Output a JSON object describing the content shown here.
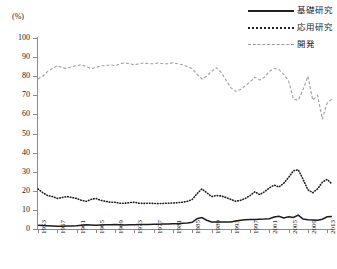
{
  "chart_data": {
    "type": "line",
    "title": "",
    "xlabel": "",
    "ylabel": "(%)",
    "unit_label": "(%)",
    "ylim": [
      0,
      100
    ],
    "yticks": [
      0,
      10,
      20,
      30,
      40,
      50,
      60,
      70,
      80,
      90,
      100
    ],
    "grid": false,
    "legend_position": "top-right",
    "x": [
      1953,
      1954,
      1955,
      1956,
      1957,
      1958,
      1959,
      1960,
      1961,
      1962,
      1963,
      1964,
      1965,
      1966,
      1967,
      1968,
      1969,
      1970,
      1971,
      1972,
      1973,
      1974,
      1975,
      1976,
      1977,
      1978,
      1979,
      1980,
      1981,
      1982,
      1983,
      1984,
      1985,
      1986,
      1987,
      1988,
      1989,
      1990,
      1991,
      1992,
      1993,
      1994,
      1995,
      1996,
      1997,
      1998,
      1999,
      2000,
      2001,
      2002,
      2003,
      2004,
      2005,
      2006,
      2007,
      2008,
      2009,
      2010,
      2011,
      2012,
      2013,
      2014
    ],
    "xtick_labels": [
      "1953",
      "1957",
      "1961",
      "1965",
      "1969",
      "1973",
      "1977",
      "1981",
      "1985",
      "1989",
      "1993",
      "1997",
      "2001",
      "2005",
      "2009",
      "2013"
    ],
    "series": [
      {
        "name": "基礎研究",
        "style": "solid",
        "color": "#1c1c1c",
        "values": [
          2.0,
          1.8,
          1.7,
          1.6,
          1.5,
          1.5,
          1.6,
          1.6,
          1.7,
          2.0,
          2.2,
          2.1,
          2.0,
          2.1,
          2.2,
          2.2,
          2.3,
          2.2,
          2.1,
          2.2,
          2.2,
          2.3,
          2.3,
          2.4,
          2.5,
          2.5,
          2.6,
          2.6,
          2.7,
          2.8,
          3.0,
          3.2,
          3.5,
          5.4,
          6.0,
          4.6,
          3.7,
          3.6,
          3.6,
          3.6,
          3.7,
          4.2,
          4.6,
          4.8,
          5.0,
          5.0,
          5.1,
          5.2,
          5.4,
          6.3,
          6.7,
          5.8,
          6.4,
          6.0,
          7.3,
          5.2,
          4.8,
          4.7,
          4.6,
          5.1,
          6.4,
          6.6
        ]
      },
      {
        "name": "応用研究",
        "style": "dotted",
        "color": "#1c1c1c",
        "values": [
          21.0,
          19.0,
          17.5,
          17.0,
          16.0,
          16.5,
          17.0,
          16.5,
          16.0,
          15.0,
          14.5,
          15.5,
          16.0,
          15.0,
          14.5,
          14.0,
          14.0,
          13.5,
          13.5,
          13.8,
          14.0,
          13.5,
          13.4,
          13.5,
          13.4,
          13.3,
          13.4,
          13.5,
          13.6,
          13.8,
          14.0,
          14.5,
          15.5,
          18.5,
          21.0,
          19.0,
          17.0,
          17.5,
          17.3,
          16.5,
          15.5,
          14.5,
          15.0,
          16.0,
          17.5,
          19.5,
          18.0,
          19.5,
          21.5,
          23.0,
          22.0,
          24.0,
          27.0,
          30.5,
          31.0,
          26.0,
          20.5,
          19.0,
          21.0,
          24.5,
          26.0,
          23.5
        ]
      },
      {
        "name": "開発",
        "style": "dashed",
        "color": "#a0a0a0",
        "values": [
          78.5,
          80.0,
          82.5,
          84.0,
          85.5,
          84.5,
          84.0,
          85.0,
          85.5,
          86.0,
          85.0,
          84.0,
          84.5,
          85.5,
          85.5,
          86.0,
          85.5,
          86.5,
          87.0,
          86.5,
          86.0,
          86.5,
          87.0,
          86.5,
          86.5,
          87.0,
          86.5,
          86.5,
          87.0,
          86.5,
          86.0,
          85.0,
          84.0,
          81.0,
          78.5,
          80.0,
          82.5,
          84.5,
          82.0,
          78.0,
          74.0,
          72.0,
          73.0,
          75.0,
          77.0,
          79.5,
          78.0,
          79.5,
          82.5,
          84.0,
          83.5,
          81.0,
          77.5,
          68.0,
          67.5,
          73.0,
          80.0,
          67.5,
          70.0,
          57.5,
          66.0,
          68.0
        ]
      }
    ]
  },
  "legend": {
    "items": [
      {
        "label": "基礎研究",
        "style": "solid"
      },
      {
        "label": "応用研究",
        "style": "dotted"
      },
      {
        "label": "開発",
        "style": "dashed"
      }
    ]
  }
}
